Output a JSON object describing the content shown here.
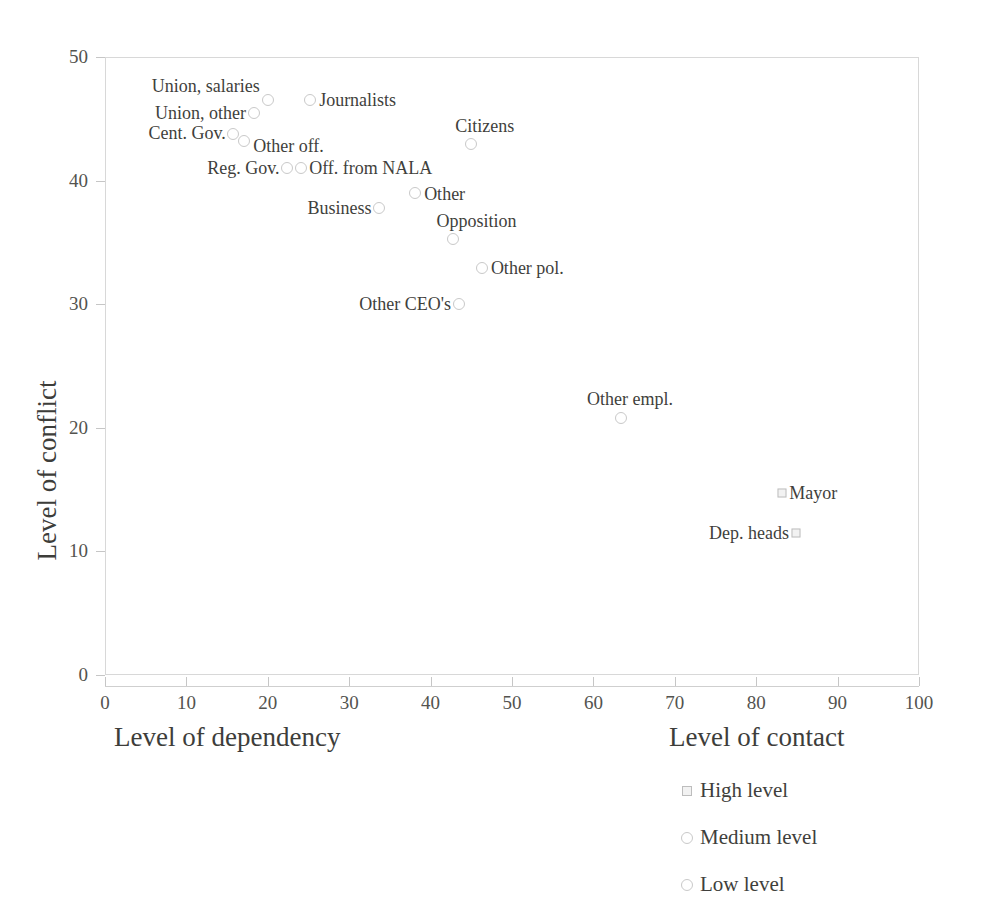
{
  "chart_data": {
    "type": "scatter",
    "title": "",
    "xlabel": "Level of dependency",
    "ylabel": "Level of conflict",
    "xlim": [
      0,
      100
    ],
    "ylim": [
      0,
      50
    ],
    "grid": false,
    "xticks": [
      0,
      10,
      20,
      30,
      40,
      50,
      60,
      70,
      80,
      90,
      100
    ],
    "yticks": [
      0,
      10,
      20,
      30,
      40,
      50
    ],
    "xtick_labels": [
      "0",
      "10",
      "20",
      "30",
      "40",
      "50",
      "60",
      "70",
      "80",
      "90",
      "100"
    ],
    "ytick_labels": [
      "0",
      "10",
      "20",
      "30",
      "40",
      "50"
    ],
    "legend": {
      "title": "Level of contact",
      "position": "below-right",
      "entries": [
        {
          "label": "High level",
          "marker": "square-high"
        },
        {
          "label": "Medium level",
          "marker": "circle-med"
        },
        {
          "label": "Low level",
          "marker": "circle-low"
        }
      ]
    },
    "points": [
      {
        "label": "Union, salaries",
        "x": 20,
        "y": 46.5,
        "marker": "circle-low",
        "label_side": "left",
        "label_dx": -8,
        "label_dy": -14
      },
      {
        "label": "Union, other",
        "x": 18.3,
        "y": 45.5,
        "marker": "circle-low",
        "label_side": "left",
        "label_dx": -8,
        "label_dy": 0
      },
      {
        "label": "Journalists",
        "x": 25.2,
        "y": 46.5,
        "marker": "circle-low",
        "label_side": "right",
        "label_dx": 9,
        "label_dy": 0
      },
      {
        "label": "Cent. Gov.",
        "x": 15.7,
        "y": 43.8,
        "marker": "circle-low",
        "label_side": "left",
        "label_dx": -7,
        "label_dy": -1
      },
      {
        "label": "Other off.",
        "x": 17.1,
        "y": 43.2,
        "marker": "circle-low",
        "label_side": "right",
        "label_dx": 9,
        "label_dy": 5
      },
      {
        "label": "Citizens",
        "x": 45,
        "y": 43,
        "marker": "circle-low",
        "label_side": "right",
        "label_dx": -16,
        "label_dy": -18
      },
      {
        "label": "Reg. Gov.",
        "x": 22.3,
        "y": 41,
        "marker": "circle-low",
        "label_side": "left",
        "label_dx": -7,
        "label_dy": 0
      },
      {
        "label": "Off. from NALA",
        "x": 24.1,
        "y": 41,
        "marker": "circle-low",
        "label_side": "right",
        "label_dx": 8,
        "label_dy": 0
      },
      {
        "label": "Other",
        "x": 38.1,
        "y": 39,
        "marker": "circle-low",
        "label_side": "right",
        "label_dx": 9,
        "label_dy": 1
      },
      {
        "label": "Business",
        "x": 33.6,
        "y": 37.8,
        "marker": "circle-low",
        "label_side": "left",
        "label_dx": -7,
        "label_dy": 0
      },
      {
        "label": "Opposition",
        "x": 42.8,
        "y": 35.3,
        "marker": "circle-low",
        "label_side": "right",
        "label_dx": -17,
        "label_dy": -18
      },
      {
        "label": "Other pol.",
        "x": 46.3,
        "y": 32.9,
        "marker": "circle-low",
        "label_side": "right",
        "label_dx": 9,
        "label_dy": 0
      },
      {
        "label": "Other CEO's",
        "x": 43.5,
        "y": 30,
        "marker": "circle-low",
        "label_side": "left",
        "label_dx": -8,
        "label_dy": 0
      },
      {
        "label": "Other empl.",
        "x": 63.4,
        "y": 20.8,
        "marker": "circle-low",
        "label_side": "right",
        "label_dx": -34,
        "label_dy": -19
      },
      {
        "label": "Mayor",
        "x": 83.2,
        "y": 14.7,
        "marker": "square-high",
        "label_side": "right",
        "label_dx": 7,
        "label_dy": 0
      },
      {
        "label": "Dep. heads",
        "x": 84.9,
        "y": 11.5,
        "marker": "square-high",
        "label_side": "left",
        "label_dx": -7,
        "label_dy": 0
      }
    ]
  },
  "colors": {
    "marker_stroke": "#c6c6c6",
    "frame": "#d8d8d8",
    "text": "#3f3f3c",
    "background": "#ffffff"
  }
}
